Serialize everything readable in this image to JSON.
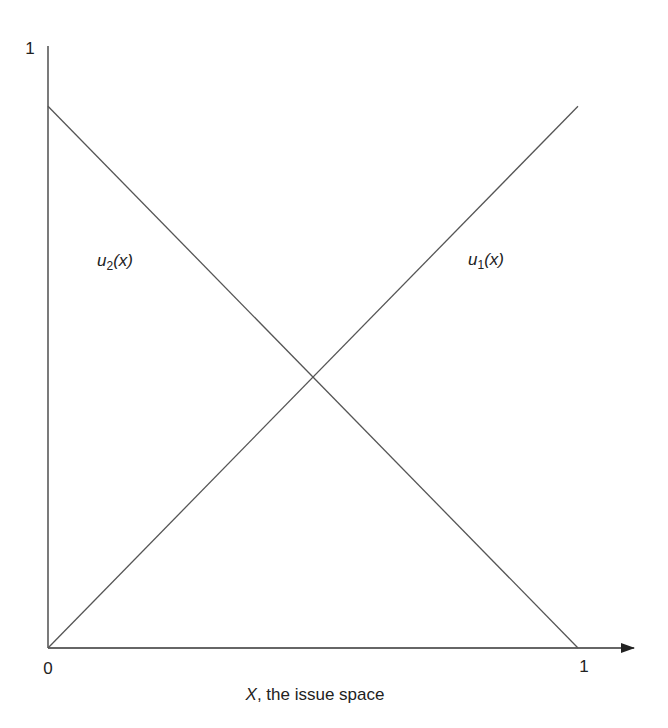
{
  "chart_data": {
    "type": "line",
    "title": "",
    "xlabel_var": "X",
    "xlabel_rest": ", the issue space",
    "ylabel": "",
    "xlim": [
      0,
      1
    ],
    "ylim": [
      0,
      1
    ],
    "grid": false,
    "x_ticks": [
      {
        "value": 0,
        "label": "0"
      },
      {
        "value": 1,
        "label": "1"
      }
    ],
    "y_ticks": [
      {
        "value": 1,
        "label": "1"
      }
    ],
    "series": [
      {
        "name": "u1(x)",
        "label_main": "u",
        "label_sub": "1",
        "label_arg": "(x)",
        "x": [
          0,
          1
        ],
        "y": [
          0,
          0.9
        ]
      },
      {
        "name": "u2(x)",
        "label_main": "u",
        "label_sub": "2",
        "label_arg": "(x)",
        "x": [
          0,
          1
        ],
        "y": [
          0.9,
          0
        ]
      }
    ],
    "line_color": "#555555",
    "axis_color": "#333333"
  }
}
